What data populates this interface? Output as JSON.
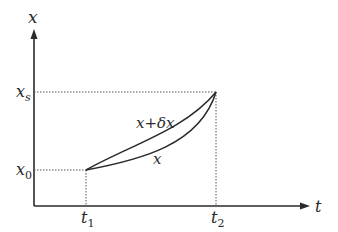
{
  "axes": {
    "y_label": "x",
    "x_label": "t"
  },
  "levels": {
    "xs": {
      "base": "x",
      "sub": "s"
    },
    "x0": {
      "base": "x",
      "sub": "0"
    }
  },
  "ticks": {
    "t1": {
      "base": "t",
      "sub": "1"
    },
    "t2": {
      "base": "t",
      "sub": "2"
    }
  },
  "curves": [
    {
      "name": "perturbed",
      "label": "x+δx"
    },
    {
      "name": "nominal",
      "label": "x"
    }
  ],
  "colors": {
    "ink": "#2a2a2a",
    "dotted": "#555555"
  }
}
